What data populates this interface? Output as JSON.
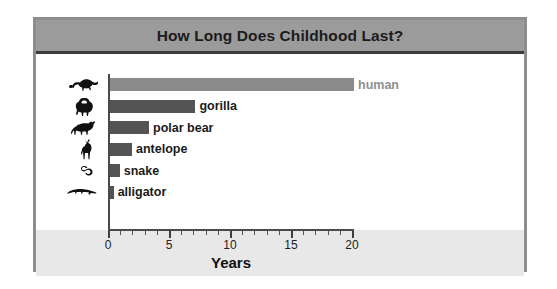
{
  "chart": {
    "title": "How Long Does Childhood Last?",
    "axis_title": "Years",
    "tick_labels": [
      "0",
      "5",
      "10",
      "15",
      "20"
    ],
    "labels": {
      "human": "human",
      "gorilla": "gorilla",
      "polar_bear": "polar bear",
      "antelope": "antelope",
      "snake": "snake",
      "alligator": "alligator"
    },
    "icons": {
      "human": "human-crawling-icon",
      "gorilla": "gorilla-icon",
      "polar_bear": "polar-bear-icon",
      "antelope": "antelope-icon",
      "snake": "snake-icon",
      "alligator": "alligator-icon"
    },
    "colors": {
      "title_bar": "#9b9b9b",
      "bar_default": "#545454",
      "bar_human": "#8b8b8b",
      "axis_band": "#e8e8e8",
      "frame": "#8e8e8e",
      "label": "#1b1b1b",
      "label_human": "#8f8f8f"
    }
  },
  "chart_data": {
    "type": "bar",
    "orientation": "horizontal",
    "title": "How Long Does Childhood Last?",
    "xlabel": "Years",
    "ylabel": "",
    "categories": [
      "human",
      "gorilla",
      "polar bear",
      "antelope",
      "snake",
      "alligator"
    ],
    "values": [
      20,
      7,
      3.2,
      1.8,
      0.8,
      0.3
    ],
    "xlim": [
      0,
      20
    ],
    "xticks": [
      0,
      5,
      10,
      15,
      20
    ],
    "minor_tick_interval": 1,
    "grid": false,
    "legend": null,
    "bar_colors": [
      "#8b8b8b",
      "#545454",
      "#545454",
      "#545454",
      "#545454",
      "#545454"
    ],
    "data_labels": [
      "human",
      "gorilla",
      "polar bear",
      "antelope",
      "snake",
      "alligator"
    ]
  }
}
